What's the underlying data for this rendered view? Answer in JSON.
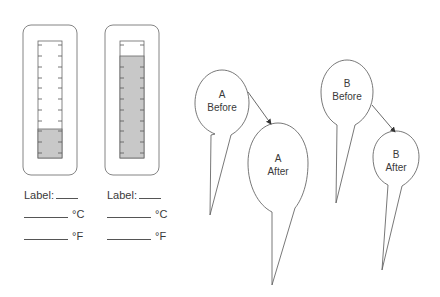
{
  "thermometers": [
    {
      "id": "left",
      "fill_level_fraction": 0.24,
      "label_text": "Label:",
      "celsius_unit": "°C",
      "fahrenheit_unit": "°F"
    },
    {
      "id": "right",
      "fill_level_fraction": 0.87,
      "label_text": "Label:",
      "celsius_unit": "°C",
      "fahrenheit_unit": "°F"
    }
  ],
  "balloons": [
    {
      "id": "a-before",
      "line1": "A",
      "line2": "Before"
    },
    {
      "id": "a-after",
      "line1": "A",
      "line2": "After"
    },
    {
      "id": "b-before",
      "line1": "B",
      "line2": "Before"
    },
    {
      "id": "b-after",
      "line1": "B",
      "line2": "After"
    }
  ],
  "colors": {
    "stroke": "#555555",
    "fill": "#c8c8c8",
    "text": "#3a3a3a",
    "background": "#ffffff"
  }
}
